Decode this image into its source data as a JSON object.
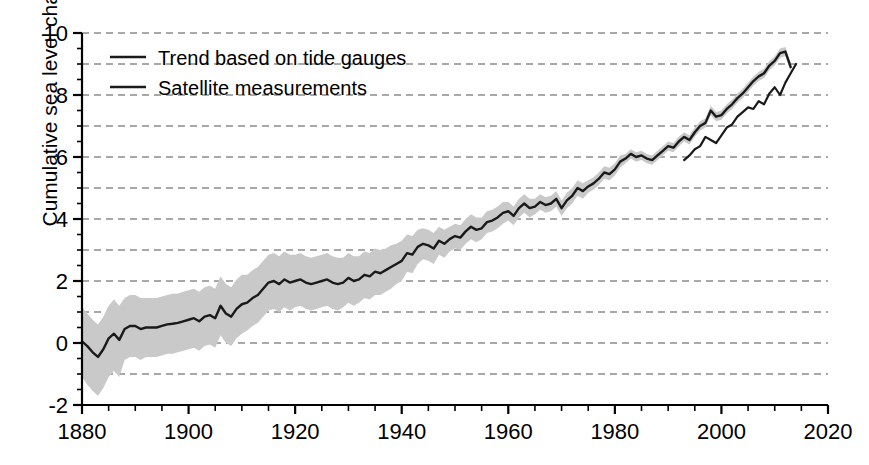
{
  "chart_data": {
    "type": "line",
    "title": "",
    "xlabel": "",
    "ylabel": "Cumulative sea level change (inches)",
    "xlim": [
      1880,
      2020
    ],
    "ylim": [
      -2,
      10
    ],
    "xticks": [
      1880,
      1900,
      1920,
      1940,
      1960,
      1980,
      2000,
      2020
    ],
    "xtick_labels": [
      "1880",
      "1900",
      "1920",
      "1940",
      "1960",
      "1980",
      "2000",
      "2020"
    ],
    "xminor_step": 5,
    "yticks": [
      -2,
      0,
      2,
      4,
      6,
      8,
      10
    ],
    "ytick_labels": [
      "-2",
      "0",
      "2",
      "4",
      "6",
      "8",
      "10"
    ],
    "yminor_step": 0.5,
    "grid": "horizontal dashed gray at every 1 inch",
    "legend_position": "upper left inside axes",
    "colors": {
      "line": "#1a1a1a",
      "band": "#c9c9c9",
      "grid": "#8c8c8c",
      "axis": "#000000",
      "background": "#ffffff"
    },
    "series": [
      {
        "name": "Trend based on tide gauges",
        "type": "line-with-uncertainty-band",
        "x": [
          1880,
          1881,
          1882,
          1883,
          1884,
          1885,
          1886,
          1887,
          1888,
          1889,
          1890,
          1891,
          1892,
          1893,
          1894,
          1895,
          1896,
          1897,
          1898,
          1899,
          1900,
          1901,
          1902,
          1903,
          1904,
          1905,
          1906,
          1907,
          1908,
          1909,
          1910,
          1911,
          1912,
          1913,
          1914,
          1915,
          1916,
          1917,
          1918,
          1919,
          1920,
          1921,
          1922,
          1923,
          1924,
          1925,
          1926,
          1927,
          1928,
          1929,
          1930,
          1931,
          1932,
          1933,
          1934,
          1935,
          1936,
          1937,
          1938,
          1939,
          1940,
          1941,
          1942,
          1943,
          1944,
          1945,
          1946,
          1947,
          1948,
          1949,
          1950,
          1951,
          1952,
          1953,
          1954,
          1955,
          1956,
          1957,
          1958,
          1959,
          1960,
          1961,
          1962,
          1963,
          1964,
          1965,
          1966,
          1967,
          1968,
          1969,
          1970,
          1971,
          1972,
          1973,
          1974,
          1975,
          1976,
          1977,
          1978,
          1979,
          1980,
          1981,
          1982,
          1983,
          1984,
          1985,
          1986,
          1987,
          1988,
          1989,
          1990,
          1991,
          1992,
          1993,
          1994,
          1995,
          1996,
          1997,
          1998,
          1999,
          2000,
          2001,
          2002,
          2003,
          2004,
          2005,
          2006,
          2007,
          2008,
          2009,
          2010,
          2011,
          2012,
          2013
        ],
        "values": [
          0.05,
          -0.1,
          -0.3,
          -0.45,
          -0.2,
          0.15,
          0.3,
          0.1,
          0.45,
          0.55,
          0.55,
          0.45,
          0.5,
          0.5,
          0.5,
          0.55,
          0.6,
          0.62,
          0.65,
          0.7,
          0.75,
          0.8,
          0.7,
          0.85,
          0.9,
          0.8,
          1.2,
          0.95,
          0.85,
          1.1,
          1.25,
          1.3,
          1.45,
          1.55,
          1.75,
          1.95,
          2.0,
          1.9,
          2.05,
          1.95,
          2.0,
          2.05,
          1.95,
          1.9,
          1.95,
          2.0,
          2.05,
          1.95,
          1.9,
          1.95,
          2.1,
          2.0,
          2.05,
          2.2,
          2.15,
          2.3,
          2.25,
          2.35,
          2.45,
          2.55,
          2.65,
          2.9,
          2.85,
          3.1,
          3.2,
          3.15,
          3.05,
          3.3,
          3.2,
          3.35,
          3.45,
          3.4,
          3.6,
          3.75,
          3.65,
          3.7,
          3.9,
          3.95,
          4.05,
          4.2,
          4.25,
          4.1,
          4.35,
          4.5,
          4.35,
          4.4,
          4.55,
          4.45,
          4.5,
          4.65,
          4.35,
          4.6,
          4.75,
          5.0,
          4.9,
          5.05,
          5.15,
          5.3,
          5.5,
          5.45,
          5.6,
          5.85,
          5.95,
          6.1,
          6.0,
          6.05,
          5.95,
          5.9,
          6.05,
          6.2,
          6.35,
          6.3,
          6.5,
          6.65,
          6.55,
          6.8,
          7.0,
          7.1,
          7.5,
          7.3,
          7.35,
          7.55,
          7.7,
          7.9,
          8.05,
          8.25,
          8.45,
          8.6,
          8.7,
          8.95,
          9.1,
          9.35,
          9.4,
          8.9
        ],
        "band_lower": [
          -1.1,
          -1.35,
          -1.55,
          -1.7,
          -1.45,
          -1.1,
          -0.9,
          -1.1,
          -0.55,
          -0.45,
          -0.45,
          -0.55,
          -0.45,
          -0.45,
          -0.45,
          -0.4,
          -0.35,
          -0.35,
          -0.3,
          -0.25,
          -0.2,
          -0.15,
          -0.25,
          -0.1,
          -0.05,
          -0.15,
          0.25,
          0.0,
          -0.1,
          0.15,
          0.3,
          0.4,
          0.55,
          0.65,
          0.85,
          1.05,
          1.1,
          1.0,
          1.15,
          1.05,
          1.15,
          1.2,
          1.1,
          1.05,
          1.1,
          1.15,
          1.2,
          1.1,
          1.05,
          1.15,
          1.3,
          1.2,
          1.3,
          1.45,
          1.4,
          1.55,
          1.55,
          1.65,
          1.75,
          1.9,
          2.0,
          2.3,
          2.25,
          2.55,
          2.7,
          2.65,
          2.55,
          2.85,
          2.75,
          2.95,
          3.05,
          3.0,
          3.2,
          3.35,
          3.25,
          3.35,
          3.55,
          3.6,
          3.7,
          3.85,
          3.95,
          3.8,
          4.05,
          4.2,
          4.05,
          4.15,
          4.3,
          4.2,
          4.25,
          4.4,
          4.1,
          4.35,
          4.5,
          4.75,
          4.65,
          4.85,
          4.95,
          5.1,
          5.3,
          5.25,
          5.4,
          5.65,
          5.8,
          5.95,
          5.85,
          5.9,
          5.8,
          5.75,
          5.9,
          6.05,
          6.2,
          6.15,
          6.35,
          6.5,
          6.4,
          6.65,
          6.85,
          6.95,
          7.35,
          7.15,
          7.2,
          7.4,
          7.55,
          7.75,
          7.9,
          8.1,
          8.3,
          8.45,
          8.55,
          8.8,
          8.95,
          9.2,
          9.25,
          8.75
        ],
        "band_upper": [
          1.15,
          0.95,
          0.75,
          0.6,
          0.85,
          1.2,
          1.4,
          1.2,
          1.45,
          1.55,
          1.55,
          1.45,
          1.45,
          1.45,
          1.45,
          1.5,
          1.55,
          1.59,
          1.6,
          1.65,
          1.7,
          1.75,
          1.65,
          1.8,
          1.85,
          1.75,
          2.15,
          1.9,
          1.8,
          2.05,
          2.2,
          2.2,
          2.35,
          2.45,
          2.65,
          2.85,
          2.9,
          2.8,
          2.95,
          2.85,
          2.85,
          2.9,
          2.8,
          2.75,
          2.8,
          2.85,
          2.9,
          2.8,
          2.75,
          2.75,
          2.9,
          2.8,
          2.8,
          2.95,
          2.9,
          3.05,
          3.0,
          3.05,
          3.15,
          3.2,
          3.3,
          3.5,
          3.45,
          3.65,
          3.7,
          3.65,
          3.55,
          3.75,
          3.65,
          3.75,
          3.85,
          3.8,
          4.0,
          4.15,
          4.05,
          4.05,
          4.25,
          4.3,
          4.4,
          4.55,
          4.55,
          4.4,
          4.65,
          4.8,
          4.65,
          4.65,
          4.8,
          4.7,
          4.75,
          4.9,
          4.6,
          4.85,
          5.0,
          5.25,
          5.15,
          5.25,
          5.35,
          5.5,
          5.7,
          5.65,
          5.8,
          6.05,
          6.1,
          6.25,
          6.15,
          6.2,
          6.1,
          6.05,
          6.2,
          6.35,
          6.5,
          6.45,
          6.65,
          6.8,
          6.7,
          6.95,
          7.15,
          7.25,
          7.65,
          7.45,
          7.5,
          7.7,
          7.85,
          8.05,
          8.2,
          8.4,
          8.6,
          8.75,
          8.85,
          9.1,
          9.25,
          9.5,
          9.55,
          9.05
        ]
      },
      {
        "name": "Satellite measurements",
        "type": "line",
        "x": [
          1993,
          1994,
          1995,
          1996,
          1997,
          1998,
          1999,
          2000,
          2001,
          2002,
          2003,
          2004,
          2005,
          2006,
          2007,
          2008,
          2009,
          2010,
          2011,
          2012,
          2013,
          2014
        ],
        "values": [
          5.9,
          6.05,
          6.25,
          6.35,
          6.65,
          6.55,
          6.45,
          6.7,
          6.95,
          7.05,
          7.3,
          7.45,
          7.6,
          7.55,
          7.8,
          7.7,
          8.05,
          8.25,
          8.0,
          8.4,
          8.7,
          9.0
        ]
      }
    ]
  },
  "legend": {
    "items": [
      {
        "label": "Trend based on tide gauges"
      },
      {
        "label": "Satellite measurements"
      }
    ]
  },
  "axes": {
    "y_axis_title": "Cumulative sea level change (inches)"
  }
}
